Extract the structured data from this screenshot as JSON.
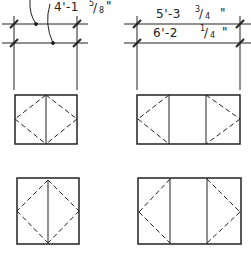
{
  "diagram": {
    "left_dimension": {
      "label_main": "4'-1",
      "frac_num": "5",
      "frac_den": "8",
      "inch_mark": "\""
    },
    "right_dimensions": [
      {
        "label_main": "5'-3",
        "frac_num": "3",
        "frac_den": "4",
        "inch_mark": "\""
      },
      {
        "label_main": "6'-2 ",
        "frac_num": "1",
        "frac_den": "4",
        "inch_mark": "\""
      }
    ],
    "colors": {
      "line": "#222222",
      "background": "#ffffff"
    },
    "panels": [
      {
        "name": "top-left-box",
        "type": "single-diamond"
      },
      {
        "name": "top-right-box",
        "type": "split-half-diamonds"
      },
      {
        "name": "bottom-left-box",
        "type": "single-diamond"
      },
      {
        "name": "bottom-right-box",
        "type": "split-half-diamonds"
      }
    ]
  }
}
